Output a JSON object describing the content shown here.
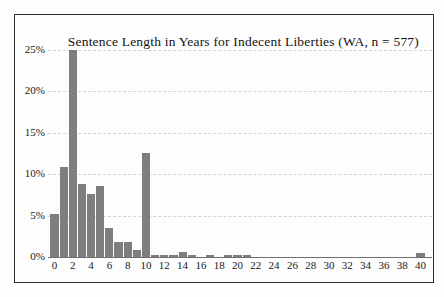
{
  "chart": {
    "title": "Sentence Length in Years for Indecent Liberties (WA, n = 577)"
  },
  "chart_data": {
    "type": "bar",
    "title": "Sentence Length in Years for Indecent Liberties (WA, n = 577)",
    "xlabel": "",
    "ylabel": "",
    "x_tick_labels": [
      "0",
      "2",
      "4",
      "6",
      "8",
      "10",
      "12",
      "14",
      "16",
      "18",
      "20",
      "22",
      "24",
      "26",
      "28",
      "30",
      "32",
      "34",
      "36",
      "38",
      "40"
    ],
    "x_tick_values": [
      0,
      2,
      4,
      6,
      8,
      10,
      12,
      14,
      16,
      18,
      20,
      22,
      24,
      26,
      28,
      30,
      32,
      34,
      36,
      38,
      40
    ],
    "y_tick_labels": [
      "0%",
      "5%",
      "10%",
      "15%",
      "20%",
      "25%"
    ],
    "y_tick_values": [
      0,
      5,
      10,
      15,
      20,
      25
    ],
    "ylim": [
      0,
      26
    ],
    "xlim": [
      -1,
      41
    ],
    "grid": "horizontal-light",
    "legend": "none",
    "bar_color": "#7e7e7e",
    "bars": [
      {
        "x": 0,
        "pct": 5.2
      },
      {
        "x": 1,
        "pct": 10.9
      },
      {
        "x": 2,
        "pct": 25.0
      },
      {
        "x": 3,
        "pct": 8.8
      },
      {
        "x": 4,
        "pct": 7.6
      },
      {
        "x": 5,
        "pct": 8.6
      },
      {
        "x": 6,
        "pct": 3.5
      },
      {
        "x": 7,
        "pct": 1.8
      },
      {
        "x": 8,
        "pct": 1.8
      },
      {
        "x": 9,
        "pct": 0.9
      },
      {
        "x": 10,
        "pct": 12.5
      },
      {
        "x": 11,
        "pct": 0.25
      },
      {
        "x": 12,
        "pct": 0.3
      },
      {
        "x": 13,
        "pct": 0.3
      },
      {
        "x": 14,
        "pct": 0.55
      },
      {
        "x": 15,
        "pct": 0.25
      },
      {
        "x": 17,
        "pct": 0.25
      },
      {
        "x": 19,
        "pct": 0.25
      },
      {
        "x": 20,
        "pct": 0.3
      },
      {
        "x": 21,
        "pct": 0.25
      },
      {
        "x": 40,
        "pct": 0.45
      }
    ]
  }
}
